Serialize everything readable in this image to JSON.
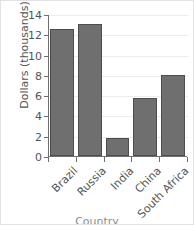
{
  "chart_data": {
    "type": "bar",
    "title": "",
    "xlabel": "Country",
    "ylabel": "Dollars (thousands)",
    "categories": [
      "Brazil",
      "Russia",
      "India",
      "China",
      "South Africa"
    ],
    "values": [
      12.5,
      13.0,
      1.8,
      5.7,
      8.0
    ],
    "ylim": [
      0,
      14
    ],
    "ytick_labels": [
      "0",
      "2",
      "4",
      "6",
      "8",
      "10",
      "12",
      "14"
    ],
    "ytick_values": [
      0,
      2,
      4,
      6,
      8,
      10,
      12,
      14
    ],
    "grid": "horizontal",
    "legend": "none",
    "bar_color": "#706f6f",
    "bar_edge_color": "#4e4d4d",
    "axis_color": "#6f6e6e",
    "grid_color": "#ececec",
    "text_color": "#555454",
    "xlabel_clipped": true
  }
}
